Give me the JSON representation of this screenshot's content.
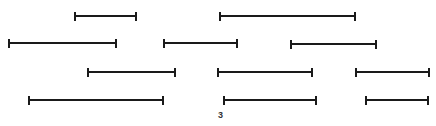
{
  "figure": {
    "label": "3",
    "label_pos": {
      "x": 218,
      "y": 110
    },
    "line_color": "#1a1a1a",
    "segments": [
      {
        "row": 1,
        "x1": 74,
        "x2": 137,
        "y": 16
      },
      {
        "row": 1,
        "x1": 219,
        "x2": 356,
        "y": 16
      },
      {
        "row": 2,
        "x1": 8,
        "x2": 117,
        "y": 43
      },
      {
        "row": 2,
        "x1": 163,
        "x2": 238,
        "y": 43
      },
      {
        "row": 2,
        "x1": 290,
        "x2": 377,
        "y": 44
      },
      {
        "row": 3,
        "x1": 87,
        "x2": 176,
        "y": 72
      },
      {
        "row": 3,
        "x1": 217,
        "x2": 313,
        "y": 72
      },
      {
        "row": 3,
        "x1": 355,
        "x2": 430,
        "y": 72
      },
      {
        "row": 4,
        "x1": 28,
        "x2": 164,
        "y": 100
      },
      {
        "row": 4,
        "x1": 223,
        "x2": 317,
        "y": 100
      },
      {
        "row": 4,
        "x1": 365,
        "x2": 429,
        "y": 100
      }
    ]
  }
}
